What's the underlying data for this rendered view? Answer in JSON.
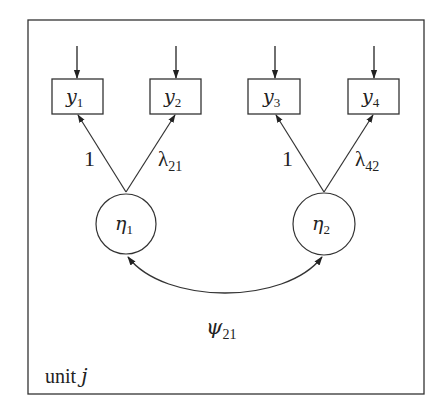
{
  "diagram": {
    "type": "structural-equation-path-diagram",
    "frame_label": {
      "text": "unit ",
      "var": "j"
    },
    "observed": [
      {
        "id": "y1",
        "base": "y",
        "sub": "1"
      },
      {
        "id": "y2",
        "base": "y",
        "sub": "2"
      },
      {
        "id": "y3",
        "base": "y",
        "sub": "3"
      },
      {
        "id": "y4",
        "base": "y",
        "sub": "4"
      }
    ],
    "latent": [
      {
        "id": "eta1",
        "base": "η",
        "sub": "1"
      },
      {
        "id": "eta2",
        "base": "η",
        "sub": "2"
      }
    ],
    "loadings": [
      {
        "from": "eta1",
        "to": "y1",
        "label": "1",
        "sub": ""
      },
      {
        "from": "eta1",
        "to": "y2",
        "label": "λ",
        "sub": "21"
      },
      {
        "from": "eta2",
        "to": "y3",
        "label": "1",
        "sub": ""
      },
      {
        "from": "eta2",
        "to": "y4",
        "label": "λ",
        "sub": "42"
      }
    ],
    "covariance": {
      "between": [
        "eta1",
        "eta2"
      ],
      "label": "ψ",
      "sub": "21"
    },
    "error_arrows": [
      "y1",
      "y2",
      "y3",
      "y4"
    ],
    "colors": {
      "stroke": "#333333",
      "background": "#ffffff"
    }
  }
}
